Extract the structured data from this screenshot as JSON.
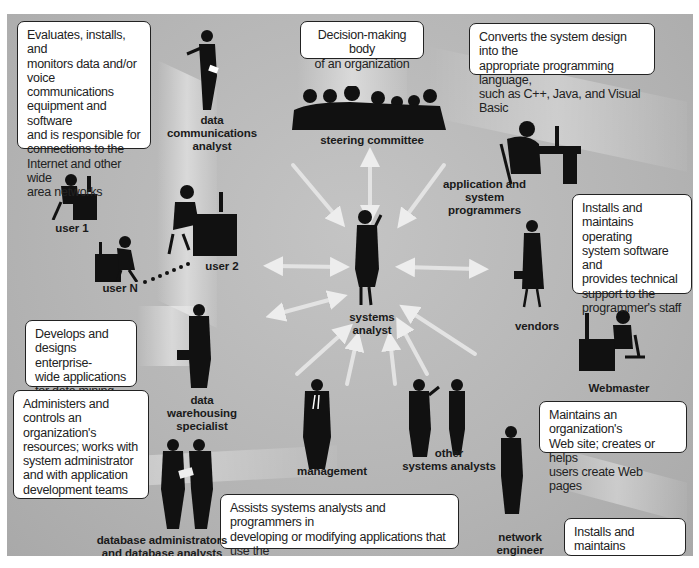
{
  "diagram": {
    "center": {
      "label": "systems\nanalyst"
    },
    "roles": [
      {
        "id": "data-communications-analyst",
        "label": "data\ncommunications\nanalyst",
        "description": "Evaluates, installs, and\nmonitors data and/or\nvoice communications\nequipment and software\nand is responsible for\nconnections to the\nInternet and other wide\narea networks"
      },
      {
        "id": "steering-committee",
        "label": "steering committee",
        "description": "Decision-making body\nof an organization"
      },
      {
        "id": "application-system-programmers",
        "label": "application and\nsystem\nprogrammers",
        "description": "Converts the system design into the\nappropriate programming language,\nsuch as C++, Java, and Visual Basic"
      },
      {
        "id": "systems-programmer-note",
        "label": "",
        "description": "Installs and\nmaintains operating\nsystem software and\nprovides technical\nsupport to the\nprogrammer's staff"
      },
      {
        "id": "user-1",
        "label": "user 1",
        "description": ""
      },
      {
        "id": "user-2",
        "label": "user 2",
        "description": ""
      },
      {
        "id": "user-n",
        "label": "user N",
        "description": ""
      },
      {
        "id": "vendors",
        "label": "vendors",
        "description": ""
      },
      {
        "id": "data-warehousing-specialist",
        "label": "data\nwarehousing\nspecialist",
        "description": "Develops and\ndesigns enterprise-\nwide applications\nfor data mining"
      },
      {
        "id": "webmaster",
        "label": "Webmaster",
        "description": "Maintains an organization's\nWeb site; creates or helps\nusers create Web pages"
      },
      {
        "id": "database-administrators",
        "label": "database administrators\nand database analysts",
        "description": "Administers and\ncontrols an organization's\nresources; works with\nsystem administrator\nand with application\ndevelopment teams"
      },
      {
        "id": "database-analysts-note",
        "label": "",
        "description": "Assists systems analysts and programmers in\ndeveloping or modifying applications that use the\ncompany's database"
      },
      {
        "id": "management",
        "label": "management",
        "description": ""
      },
      {
        "id": "other-systems-analysts",
        "label": "other\nsystems analysts",
        "description": ""
      },
      {
        "id": "network-engineer",
        "label": "network\nengineer",
        "description": "Installs and maintains\nlocal area networks"
      }
    ],
    "colors": {
      "background": "#b8b8b8",
      "silhouette": "#111111",
      "box_border": "#222222",
      "arrow": "#e8e8e8"
    }
  }
}
